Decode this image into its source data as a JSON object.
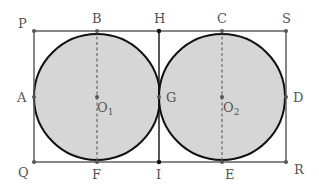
{
  "diagram": {
    "type": "geometry",
    "colors": {
      "background": "#ffffff",
      "circle_fill": "#d6d6d6",
      "circle_stroke": "#111111",
      "rect_stroke": "#555555",
      "dashed": "#666666",
      "point": "#555555",
      "label": "#555555"
    },
    "labels": {
      "P": "P",
      "B": "B",
      "H": "H",
      "C": "C",
      "S": "S",
      "A": "A",
      "G": "G",
      "D": "D",
      "Q": "Q",
      "F": "F",
      "I": "I",
      "E": "E",
      "R": "R",
      "O1": "O",
      "O1_sub": "1",
      "O2": "O",
      "O2_sub": "2"
    },
    "points": [
      {
        "name": "P",
        "x": 34,
        "y": 31
      },
      {
        "name": "B",
        "x": 97,
        "y": 31
      },
      {
        "name": "H",
        "x": 159,
        "y": 31
      },
      {
        "name": "C",
        "x": 222,
        "y": 31
      },
      {
        "name": "S",
        "x": 286,
        "y": 31
      },
      {
        "name": "A",
        "x": 34,
        "y": 97
      },
      {
        "name": "O1",
        "x": 97,
        "y": 97
      },
      {
        "name": "G",
        "x": 159,
        "y": 97
      },
      {
        "name": "O2",
        "x": 222,
        "y": 97
      },
      {
        "name": "D",
        "x": 286,
        "y": 97
      },
      {
        "name": "Q",
        "x": 34,
        "y": 162
      },
      {
        "name": "F",
        "x": 97,
        "y": 162
      },
      {
        "name": "I",
        "x": 159,
        "y": 162
      },
      {
        "name": "E",
        "x": 222,
        "y": 162
      },
      {
        "name": "R",
        "x": 286,
        "y": 162
      }
    ],
    "circles": [
      {
        "center": "O1",
        "radius": 63
      },
      {
        "center": "O2",
        "radius": 63
      }
    ],
    "segments": [
      {
        "from": "P",
        "to": "S",
        "style": "solid"
      },
      {
        "from": "Q",
        "to": "R",
        "style": "solid"
      },
      {
        "from": "P",
        "to": "Q",
        "style": "solid"
      },
      {
        "from": "S",
        "to": "R",
        "style": "solid"
      },
      {
        "from": "H",
        "to": "I",
        "style": "solid"
      },
      {
        "from": "B",
        "to": "F",
        "style": "dashed"
      },
      {
        "from": "C",
        "to": "E",
        "style": "dashed"
      }
    ]
  }
}
